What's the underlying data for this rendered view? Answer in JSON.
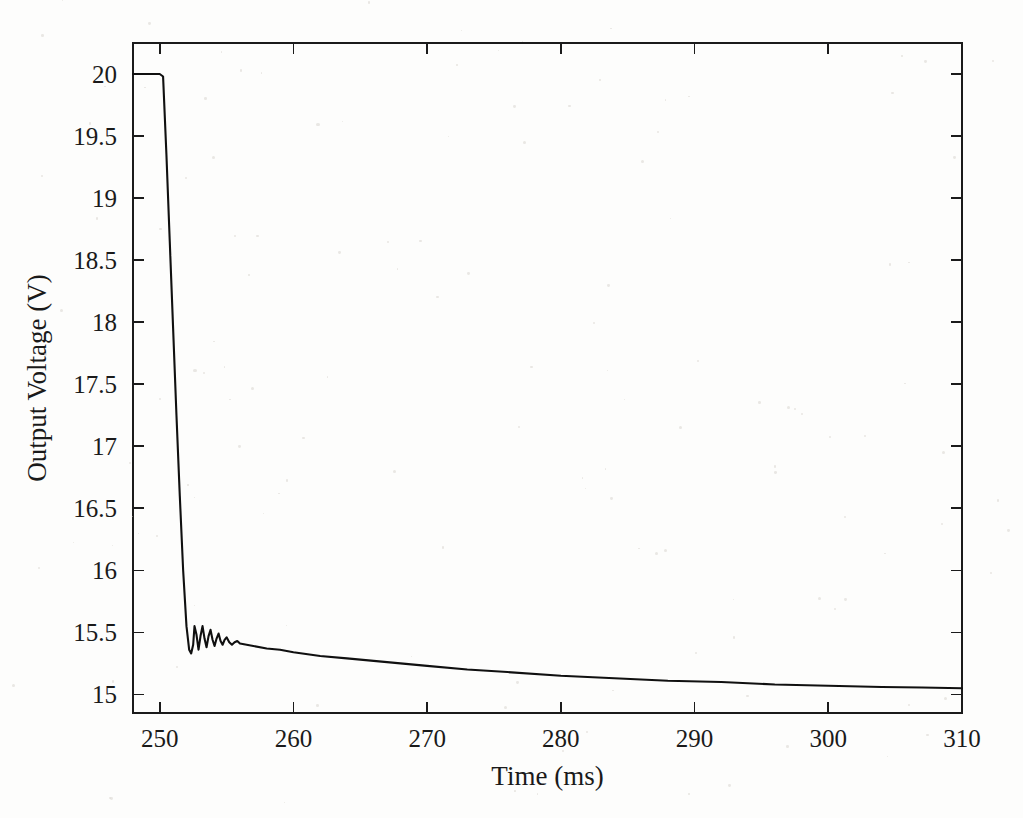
{
  "figure": {
    "background_color": "#fdfdfc",
    "line_color": "#101010",
    "axis_color": "#1b1b1b"
  },
  "chart_data": {
    "type": "line",
    "title": "",
    "xlabel": "Time (ms)",
    "ylabel": "Output Voltage (V)",
    "xlim": [
      248.0,
      310.0
    ],
    "ylim": [
      14.85,
      20.25
    ],
    "xticks": [
      250,
      260,
      270,
      280,
      290,
      300,
      310
    ],
    "xtick_labels": [
      "250",
      "260",
      "270",
      "280",
      "290",
      "300",
      "310"
    ],
    "yticks": [
      15,
      15.5,
      16,
      16.5,
      17,
      17.5,
      18,
      18.5,
      19,
      19.5,
      20
    ],
    "ytick_labels": [
      "15",
      "15.5",
      "16",
      "16.5",
      "17",
      "17.5",
      "18",
      "18.5",
      "19",
      "19.5",
      "20"
    ],
    "grid": false,
    "legend": null,
    "legend_position": "none",
    "annotations": [],
    "series": [
      {
        "name": "Output Voltage",
        "color": "#101010",
        "x": [
          248.0,
          248.5,
          249.0,
          249.5,
          250.0,
          250.25,
          250.5,
          250.75,
          251.0,
          251.25,
          251.5,
          251.75,
          252.0,
          252.2,
          252.35,
          252.5,
          252.6,
          252.75,
          252.9,
          253.05,
          253.2,
          253.35,
          253.5,
          253.65,
          253.8,
          253.95,
          254.1,
          254.25,
          254.4,
          254.55,
          254.7,
          254.85,
          255.0,
          255.2,
          255.4,
          255.6,
          255.8,
          256.0,
          256.5,
          257.0,
          258.0,
          259.0,
          260.0,
          262.0,
          264.0,
          266.0,
          268.0,
          270.0,
          273.0,
          276.0,
          280.0,
          284.0,
          288.0,
          292.0,
          296.0,
          300.0,
          304.0,
          307.0,
          310.0
        ],
        "y": [
          20.0,
          20.0,
          20.0,
          20.0,
          20.0,
          19.98,
          19.35,
          18.65,
          17.95,
          17.25,
          16.6,
          16.0,
          15.55,
          15.36,
          15.33,
          15.4,
          15.55,
          15.48,
          15.36,
          15.47,
          15.55,
          15.45,
          15.38,
          15.47,
          15.52,
          15.44,
          15.39,
          15.45,
          15.49,
          15.43,
          15.4,
          15.44,
          15.46,
          15.42,
          15.4,
          15.42,
          15.43,
          15.41,
          15.4,
          15.39,
          15.37,
          15.36,
          15.34,
          15.31,
          15.29,
          15.27,
          15.25,
          15.23,
          15.2,
          15.18,
          15.15,
          15.13,
          15.11,
          15.1,
          15.08,
          15.07,
          15.06,
          15.055,
          15.05
        ]
      }
    ]
  }
}
